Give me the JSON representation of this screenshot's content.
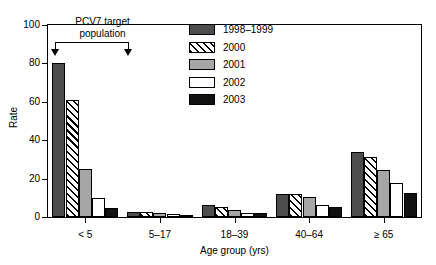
{
  "chart_data": {
    "type": "bar",
    "title": "",
    "xlabel": "Age group (yrs)",
    "ylabel": "Rate",
    "categories": [
      "< 5",
      "5–17",
      "18–39",
      "40–64",
      "≥ 65"
    ],
    "yticks": [
      0,
      20,
      40,
      60,
      80,
      100
    ],
    "ylim": [
      0,
      100
    ],
    "grid": false,
    "legend_position": "top-right",
    "series": [
      {
        "name": "1998–1999",
        "fill": "dark",
        "color": "#4d4d4d",
        "values": [
          80,
          2.5,
          6.5,
          12,
          34
        ]
      },
      {
        "name": "2000",
        "fill": "hatch",
        "color": "#ffffff",
        "values": [
          61,
          2.5,
          5,
          12,
          31
        ]
      },
      {
        "name": "2001",
        "fill": "gray",
        "color": "#a6a6a6",
        "values": [
          25,
          2,
          3.5,
          10.5,
          24.5
        ]
      },
      {
        "name": "2002",
        "fill": "white",
        "color": "#ffffff",
        "values": [
          10,
          1.5,
          2,
          6,
          17.5
        ]
      },
      {
        "name": "2003",
        "fill": "black",
        "color": "#111111",
        "values": [
          4.5,
          1,
          2,
          5,
          12.5
        ]
      }
    ],
    "annotation": {
      "line1": "PCV7 target",
      "line2": "population"
    }
  }
}
